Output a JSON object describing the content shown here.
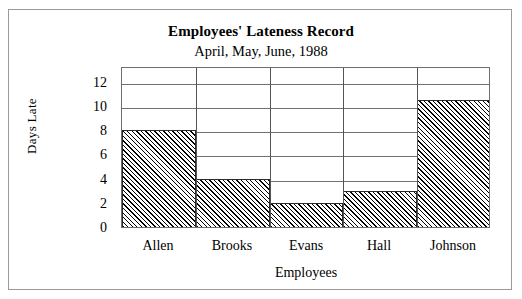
{
  "chart_data": {
    "type": "bar",
    "title": "Employees' Lateness Record",
    "subtitle": "April,  May,  June,  1988",
    "xlabel": "Employees",
    "ylabel": "Days Late",
    "categories": [
      "Allen",
      "Brooks",
      "Evans",
      "Hall",
      "Johnson"
    ],
    "values": [
      8,
      4,
      2,
      3,
      10.5
    ],
    "ylim": [
      0,
      13.3
    ],
    "yticks": [
      0,
      2,
      4,
      6,
      8,
      10,
      12
    ],
    "ytick_labels": [
      "0",
      "2",
      "4",
      "6",
      "8",
      "10",
      "12"
    ],
    "grid": "horizontal",
    "legend": "none",
    "bar_style": {
      "fill": "diagonal-hatch",
      "hatch_angle": 45,
      "edge_color": "#2b2b2b",
      "gap": 0
    },
    "colors": {
      "frame": "#9a9a9a",
      "axis": "#6e6e6e",
      "gridline": "#707070",
      "text": "#000000",
      "background": "#ffffff"
    }
  }
}
